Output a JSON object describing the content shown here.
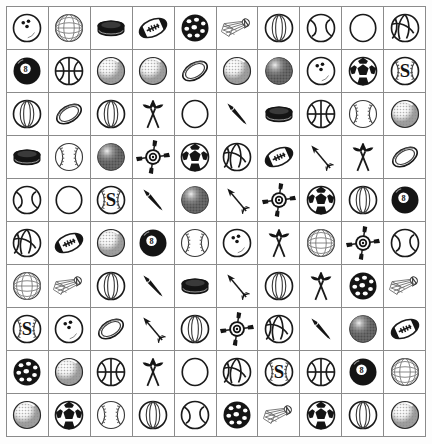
{
  "page": {
    "width": 432,
    "height": 444,
    "background_color": "#ffffff",
    "ink_color": "#141414",
    "grid_line_color": "#8b8b8b"
  },
  "grid": {
    "columns": 10,
    "rows": 10,
    "total_cells": 100,
    "cell_width": 42,
    "cell_height": 43,
    "origin_x": 6,
    "origin_y": 6
  },
  "legend": {
    "icon_types": [
      "bowling-ball-icon",
      "wireframe-ball-icon",
      "hockey-puck-icon",
      "football-icon",
      "wiffle-ball-icon",
      "eight-ball-icon",
      "basketball-icon",
      "golf-ball-icon",
      "rugby-ball-icon",
      "shuttlecock-icon",
      "beach-ball-icon",
      "tennis-ball-icon",
      "plain-ball-icon",
      "volleyball-icon",
      "disco-ball-icon",
      "soccer-ball-icon",
      "baseball-s-icon",
      "baseball-icon",
      "crossed-darts-icon",
      "dart-icon",
      "archery-target-icon",
      "arrow-icon"
    ]
  },
  "cells": [
    {
      "row": 1,
      "col": 1,
      "icon": "bowling-ball-icon",
      "label": "Bowling Ball"
    },
    {
      "row": 1,
      "col": 2,
      "icon": "wireframe-ball-icon",
      "label": "Wireframe Ball"
    },
    {
      "row": 1,
      "col": 3,
      "icon": "hockey-puck-icon",
      "label": "Hockey Puck"
    },
    {
      "row": 1,
      "col": 4,
      "icon": "football-icon",
      "label": "Football"
    },
    {
      "row": 1,
      "col": 5,
      "icon": "wiffle-ball-icon",
      "label": "Wiffle Ball"
    },
    {
      "row": 1,
      "col": 6,
      "icon": "shuttlecock-icon",
      "label": "Shuttlecock"
    },
    {
      "row": 1,
      "col": 7,
      "icon": "beach-ball-icon",
      "label": "Beach Ball"
    },
    {
      "row": 1,
      "col": 8,
      "icon": "tennis-ball-icon",
      "label": "Tennis Ball"
    },
    {
      "row": 1,
      "col": 9,
      "icon": "plain-ball-icon",
      "label": "Plain Ball"
    },
    {
      "row": 1,
      "col": 10,
      "icon": "volleyball-icon",
      "label": "Volleyball"
    },
    {
      "row": 2,
      "col": 1,
      "icon": "eight-ball-icon",
      "label": "Eight Ball"
    },
    {
      "row": 2,
      "col": 2,
      "icon": "basketball-icon",
      "label": "Basketball"
    },
    {
      "row": 2,
      "col": 3,
      "icon": "golf-ball-icon",
      "label": "Golf Ball"
    },
    {
      "row": 2,
      "col": 4,
      "icon": "golf-ball-icon",
      "label": "Golf Ball"
    },
    {
      "row": 2,
      "col": 5,
      "icon": "rugby-ball-icon",
      "label": "Rugby Ball"
    },
    {
      "row": 2,
      "col": 6,
      "icon": "golf-ball-icon",
      "label": "Golf Ball"
    },
    {
      "row": 2,
      "col": 7,
      "icon": "disco-ball-icon",
      "label": "Disco Ball"
    },
    {
      "row": 2,
      "col": 8,
      "icon": "bowling-ball-icon",
      "label": "Bowling Ball"
    },
    {
      "row": 2,
      "col": 9,
      "icon": "soccer-ball-icon",
      "label": "Soccer Ball"
    },
    {
      "row": 2,
      "col": 10,
      "icon": "baseball-s-icon",
      "label": "Baseball with S"
    },
    {
      "row": 3,
      "col": 1,
      "icon": "beach-ball-icon",
      "label": "Beach Ball"
    },
    {
      "row": 3,
      "col": 2,
      "icon": "rugby-ball-icon",
      "label": "Rugby Ball"
    },
    {
      "row": 3,
      "col": 3,
      "icon": "beach-ball-icon",
      "label": "Beach Ball"
    },
    {
      "row": 3,
      "col": 4,
      "icon": "crossed-darts-icon",
      "label": "Crossed Darts"
    },
    {
      "row": 3,
      "col": 5,
      "icon": "plain-ball-icon",
      "label": "Plain Ball"
    },
    {
      "row": 3,
      "col": 6,
      "icon": "dart-icon",
      "label": "Dart"
    },
    {
      "row": 3,
      "col": 7,
      "icon": "hockey-puck-icon",
      "label": "Hockey Puck"
    },
    {
      "row": 3,
      "col": 8,
      "icon": "basketball-icon",
      "label": "Basketball"
    },
    {
      "row": 3,
      "col": 9,
      "icon": "baseball-icon",
      "label": "Baseball"
    },
    {
      "row": 3,
      "col": 10,
      "icon": "golf-ball-icon",
      "label": "Golf Ball"
    },
    {
      "row": 4,
      "col": 1,
      "icon": "hockey-puck-icon",
      "label": "Hockey Puck"
    },
    {
      "row": 4,
      "col": 2,
      "icon": "baseball-icon",
      "label": "Baseball"
    },
    {
      "row": 4,
      "col": 3,
      "icon": "disco-ball-icon",
      "label": "Disco Ball"
    },
    {
      "row": 4,
      "col": 4,
      "icon": "archery-target-icon",
      "label": "Archery Target"
    },
    {
      "row": 4,
      "col": 5,
      "icon": "soccer-ball-icon",
      "label": "Soccer Ball"
    },
    {
      "row": 4,
      "col": 6,
      "icon": "volleyball-icon",
      "label": "Volleyball"
    },
    {
      "row": 4,
      "col": 7,
      "icon": "football-icon",
      "label": "Football"
    },
    {
      "row": 4,
      "col": 8,
      "icon": "arrow-icon",
      "label": "Arrow"
    },
    {
      "row": 4,
      "col": 9,
      "icon": "crossed-darts-icon",
      "label": "Crossed Darts"
    },
    {
      "row": 4,
      "col": 10,
      "icon": "rugby-ball-icon",
      "label": "Rugby Ball"
    },
    {
      "row": 5,
      "col": 1,
      "icon": "tennis-ball-icon",
      "label": "Tennis Ball"
    },
    {
      "row": 5,
      "col": 2,
      "icon": "plain-ball-icon",
      "label": "Plain Ball"
    },
    {
      "row": 5,
      "col": 3,
      "icon": "baseball-s-icon",
      "label": "Baseball with S"
    },
    {
      "row": 5,
      "col": 4,
      "icon": "dart-icon",
      "label": "Dart"
    },
    {
      "row": 5,
      "col": 5,
      "icon": "disco-ball-icon",
      "label": "Disco Ball"
    },
    {
      "row": 5,
      "col": 6,
      "icon": "arrow-icon",
      "label": "Arrow"
    },
    {
      "row": 5,
      "col": 7,
      "icon": "archery-target-icon",
      "label": "Archery Target"
    },
    {
      "row": 5,
      "col": 8,
      "icon": "soccer-ball-icon",
      "label": "Soccer Ball"
    },
    {
      "row": 5,
      "col": 9,
      "icon": "beach-ball-icon",
      "label": "Beach Ball"
    },
    {
      "row": 5,
      "col": 10,
      "icon": "eight-ball-icon",
      "label": "Eight Ball"
    },
    {
      "row": 6,
      "col": 1,
      "icon": "volleyball-icon",
      "label": "Volleyball"
    },
    {
      "row": 6,
      "col": 2,
      "icon": "football-icon",
      "label": "Football"
    },
    {
      "row": 6,
      "col": 3,
      "icon": "golf-ball-icon",
      "label": "Golf Ball"
    },
    {
      "row": 6,
      "col": 4,
      "icon": "eight-ball-icon",
      "label": "Eight Ball"
    },
    {
      "row": 6,
      "col": 5,
      "icon": "baseball-icon",
      "label": "Baseball"
    },
    {
      "row": 6,
      "col": 6,
      "icon": "bowling-ball-icon",
      "label": "Bowling Ball"
    },
    {
      "row": 6,
      "col": 7,
      "icon": "crossed-darts-icon",
      "label": "Crossed Darts"
    },
    {
      "row": 6,
      "col": 8,
      "icon": "wireframe-ball-icon",
      "label": "Wireframe Ball"
    },
    {
      "row": 6,
      "col": 9,
      "icon": "archery-target-icon",
      "label": "Archery Target"
    },
    {
      "row": 6,
      "col": 10,
      "icon": "tennis-ball-icon",
      "label": "Tennis Ball"
    },
    {
      "row": 7,
      "col": 1,
      "icon": "wireframe-ball-icon",
      "label": "Wireframe Ball"
    },
    {
      "row": 7,
      "col": 2,
      "icon": "shuttlecock-icon",
      "label": "Shuttlecock"
    },
    {
      "row": 7,
      "col": 3,
      "icon": "beach-ball-icon",
      "label": "Beach Ball"
    },
    {
      "row": 7,
      "col": 4,
      "icon": "dart-icon",
      "label": "Dart"
    },
    {
      "row": 7,
      "col": 5,
      "icon": "hockey-puck-icon",
      "label": "Hockey Puck"
    },
    {
      "row": 7,
      "col": 6,
      "icon": "arrow-icon",
      "label": "Arrow"
    },
    {
      "row": 7,
      "col": 7,
      "icon": "beach-ball-icon",
      "label": "Beach Ball"
    },
    {
      "row": 7,
      "col": 8,
      "icon": "crossed-darts-icon",
      "label": "Crossed Darts"
    },
    {
      "row": 7,
      "col": 9,
      "icon": "wiffle-ball-icon",
      "label": "Wiffle Ball"
    },
    {
      "row": 7,
      "col": 10,
      "icon": "shuttlecock-icon",
      "label": "Shuttlecock"
    },
    {
      "row": 8,
      "col": 1,
      "icon": "baseball-s-icon",
      "label": "Baseball with S"
    },
    {
      "row": 8,
      "col": 2,
      "icon": "bowling-ball-icon",
      "label": "Bowling Ball"
    },
    {
      "row": 8,
      "col": 3,
      "icon": "rugby-ball-icon",
      "label": "Rugby Ball"
    },
    {
      "row": 8,
      "col": 4,
      "icon": "arrow-icon",
      "label": "Arrow"
    },
    {
      "row": 8,
      "col": 5,
      "icon": "beach-ball-icon",
      "label": "Beach Ball"
    },
    {
      "row": 8,
      "col": 6,
      "icon": "archery-target-icon",
      "label": "Archery Target"
    },
    {
      "row": 8,
      "col": 7,
      "icon": "volleyball-icon",
      "label": "Volleyball"
    },
    {
      "row": 8,
      "col": 8,
      "icon": "dart-icon",
      "label": "Dart"
    },
    {
      "row": 8,
      "col": 9,
      "icon": "disco-ball-icon",
      "label": "Disco Ball"
    },
    {
      "row": 8,
      "col": 10,
      "icon": "football-icon",
      "label": "Football"
    },
    {
      "row": 9,
      "col": 1,
      "icon": "wiffle-ball-icon",
      "label": "Wiffle Ball"
    },
    {
      "row": 9,
      "col": 2,
      "icon": "golf-ball-icon",
      "label": "Golf Ball"
    },
    {
      "row": 9,
      "col": 3,
      "icon": "basketball-icon",
      "label": "Basketball"
    },
    {
      "row": 9,
      "col": 4,
      "icon": "crossed-darts-icon",
      "label": "Crossed Darts"
    },
    {
      "row": 9,
      "col": 5,
      "icon": "plain-ball-icon",
      "label": "Plain Ball"
    },
    {
      "row": 9,
      "col": 6,
      "icon": "volleyball-icon",
      "label": "Volleyball"
    },
    {
      "row": 9,
      "col": 7,
      "icon": "baseball-s-icon",
      "label": "Baseball with S"
    },
    {
      "row": 9,
      "col": 8,
      "icon": "basketball-icon",
      "label": "Basketball"
    },
    {
      "row": 9,
      "col": 9,
      "icon": "eight-ball-icon",
      "label": "Eight Ball"
    },
    {
      "row": 9,
      "col": 10,
      "icon": "wireframe-ball-icon",
      "label": "Wireframe Ball"
    },
    {
      "row": 10,
      "col": 1,
      "icon": "golf-ball-icon",
      "label": "Golf Ball"
    },
    {
      "row": 10,
      "col": 2,
      "icon": "soccer-ball-icon",
      "label": "Soccer Ball"
    },
    {
      "row": 10,
      "col": 3,
      "icon": "baseball-icon",
      "label": "Baseball"
    },
    {
      "row": 10,
      "col": 4,
      "icon": "beach-ball-icon",
      "label": "Beach Ball"
    },
    {
      "row": 10,
      "col": 5,
      "icon": "tennis-ball-icon",
      "label": "Tennis Ball"
    },
    {
      "row": 10,
      "col": 6,
      "icon": "wiffle-ball-icon",
      "label": "Wiffle Ball"
    },
    {
      "row": 10,
      "col": 7,
      "icon": "shuttlecock-icon",
      "label": "Shuttlecock"
    },
    {
      "row": 10,
      "col": 8,
      "icon": "soccer-ball-icon",
      "label": "Soccer Ball"
    },
    {
      "row": 10,
      "col": 9,
      "icon": "beach-ball-icon",
      "label": "Beach Ball"
    },
    {
      "row": 10,
      "col": 10,
      "icon": "golf-ball-icon",
      "label": "Golf Ball"
    }
  ]
}
